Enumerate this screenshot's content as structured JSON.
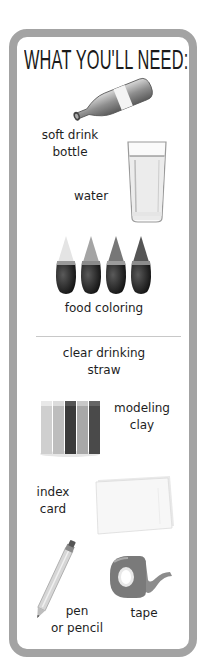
{
  "title": "WHAT YOU'LL NEED:",
  "items": [
    {
      "label_line1": "soft drink",
      "label_line2": "bottle",
      "icon": "bottle-icon"
    },
    {
      "label_line1": "water",
      "icon": "glass-of-water-icon"
    },
    {
      "label_line1": "food coloring",
      "icon": "food-coloring-bottles-icon"
    },
    {
      "label_line1": "clear drinking",
      "label_line2": "straw"
    },
    {
      "label_line1": "modeling",
      "label_line2": "clay",
      "icon": "modeling-clay-icon"
    },
    {
      "label_line1": "index",
      "label_line2": "card",
      "icon": "index-card-icon"
    },
    {
      "label_line1": "pen",
      "label_line2": "or pencil",
      "icon": "pencil-icon"
    },
    {
      "label_line1": "tape",
      "icon": "tape-dispenser-icon"
    }
  ],
  "colors": {
    "border": "#a3a3a3",
    "text": "#1e1e1e",
    "background": "#ffffff"
  }
}
